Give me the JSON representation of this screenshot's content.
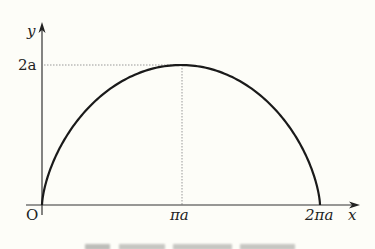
{
  "chart_data": {
    "type": "line",
    "title": "",
    "xlabel": "x",
    "ylabel": "y",
    "origin_label": "O",
    "x_ticks": [
      "πa",
      "2πa"
    ],
    "y_ticks": [
      "2a"
    ],
    "curve": "cycloid arch: x = a(t - sin t), y = a(1 - cos t), t in [0, 2π]",
    "x": [
      0,
      0.5,
      1,
      1.5,
      2,
      2.5,
      3,
      3.14159,
      3.5,
      4,
      4.5,
      5,
      5.5,
      6,
      6.28318
    ],
    "annotations": [
      "dotted guide from y=2a to maximum point",
      "dotted vertical line at x=πa"
    ],
    "xlim": [
      0,
      6.28318
    ],
    "ylim": [
      0,
      2
    ]
  },
  "labels": {
    "y_axis": "y",
    "x_axis": "x",
    "origin": "O",
    "y_max": "2a",
    "x_mid": "πa",
    "x_end": "2πa"
  },
  "colors": {
    "background": "#fdfdf8",
    "curve": "#1a1a1a",
    "axis": "#333333",
    "guide": "#999999"
  }
}
